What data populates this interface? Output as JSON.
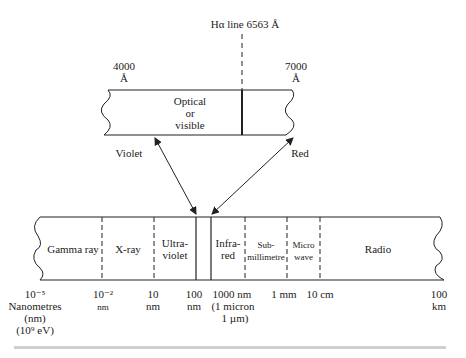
{
  "title_line": "Hα line 6563 Å",
  "optical_window": {
    "left_label": {
      "value": "4000",
      "unit": "Å"
    },
    "right_label": {
      "value": "7000",
      "unit": "Å"
    },
    "band_text": [
      "Optical",
      "or",
      "visible"
    ],
    "left_arrow_label": "Violet",
    "right_arrow_label": "Red"
  },
  "spectrum": {
    "bands": [
      {
        "name": "Gamma ray",
        "lines": [
          "Gamma ray"
        ]
      },
      {
        "name": "X-ray",
        "lines": [
          "X-ray"
        ]
      },
      {
        "name": "Ultraviolet",
        "lines": [
          "Ultra-",
          "violet"
        ]
      },
      {
        "name": "Optical",
        "lines": []
      },
      {
        "name": "Infrared",
        "lines": [
          "Infra-",
          "red"
        ]
      },
      {
        "name": "Submillimetre",
        "lines": [
          "Sub-",
          "millimetre"
        ]
      },
      {
        "name": "Microwave",
        "lines": [
          "Micro",
          "wave"
        ]
      },
      {
        "name": "Radio",
        "lines": [
          "Radio"
        ]
      }
    ],
    "ticks": [
      {
        "lines": [
          "10⁻⁵",
          "Nanometres",
          "(nm)",
          "(10⁹ eV)"
        ]
      },
      {
        "lines": [
          "10⁻²",
          "nm"
        ]
      },
      {
        "lines": [
          "10",
          "nm"
        ]
      },
      {
        "lines": [
          "100",
          "nm"
        ]
      },
      {
        "lines": [
          "1000 nm",
          "(1 micron",
          "1 µm)"
        ]
      },
      {
        "lines": [
          "1 mm"
        ]
      },
      {
        "lines": [
          "10 cm"
        ]
      },
      {
        "lines": [
          "100",
          "km"
        ]
      }
    ]
  },
  "colors": {
    "line": "#222222",
    "background": "#ffffff",
    "rule": "#cfcfcf"
  }
}
